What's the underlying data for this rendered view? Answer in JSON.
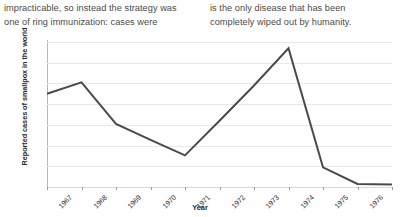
{
  "article": {
    "left_column": [
      "impracticable, so instead the strategy was",
      "one of ring immunization: cases were"
    ],
    "right_column": [
      "is the only disease that has been",
      "completely wiped out by humanity."
    ]
  },
  "chart_data": {
    "type": "line",
    "title": "",
    "xlabel": "Year",
    "ylabel": "Reported cases of smallpox in the world",
    "categories": [
      "1967",
      "1968",
      "1969",
      "1970",
      "1971",
      "1972",
      "1973",
      "1974",
      "1975",
      "1976",
      "1977"
    ],
    "x": [
      1967,
      1968,
      1969,
      1970,
      1971,
      1972,
      1973,
      1974,
      1975,
      1976,
      1977
    ],
    "values": [
      9000,
      10100,
      6100,
      4550,
      3050,
      6400,
      9800,
      13400,
      1900,
      300,
      250
    ],
    "ytick_labels": [
      "14,000",
      "12,000",
      "10,000",
      "8,000",
      "6,000",
      "4,000",
      "2,000",
      "0"
    ],
    "ytick_values": [
      14000,
      12000,
      10000,
      8000,
      6000,
      4000,
      2000,
      0
    ],
    "ylim": [
      0,
      14000
    ],
    "grid": true,
    "legend": "none",
    "line_color": "#4a4a4a",
    "grid_color": "#e9e9e9",
    "axis_color": "#b7b7b7"
  }
}
